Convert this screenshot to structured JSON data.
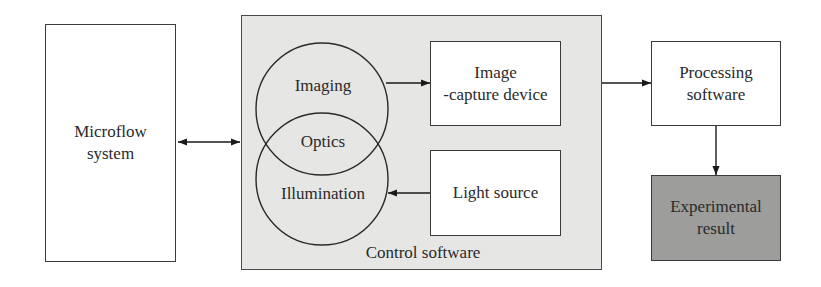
{
  "diagram": {
    "nodes": {
      "microflow": {
        "label": "Microflow\nsystem"
      },
      "control": {
        "label": "Control software"
      },
      "imaging": {
        "label": "Imaging"
      },
      "optics": {
        "label": "Optics"
      },
      "illumination": {
        "label": "Illumination"
      },
      "capture": {
        "label": "Image\n-capture device"
      },
      "light": {
        "label": "Light source"
      },
      "processing": {
        "label": "Processing\nsoftware"
      },
      "result": {
        "label": "Experimental\nresult"
      }
    },
    "edges": [
      {
        "from": "Microflow system",
        "to": "Control software",
        "type": "bidirectional"
      },
      {
        "from": "Imaging",
        "to": "Image-capture device",
        "type": "directed"
      },
      {
        "from": "Light source",
        "to": "Illumination",
        "type": "directed"
      },
      {
        "from": "Control software",
        "to": "Processing software",
        "type": "directed"
      },
      {
        "from": "Processing software",
        "to": "Experimental result",
        "type": "directed"
      }
    ],
    "colors": {
      "line": "#2a2a2a",
      "control_fill": "#e6e6e4",
      "result_fill": "#9d9d9b",
      "box_fill": "#ffffff"
    }
  }
}
